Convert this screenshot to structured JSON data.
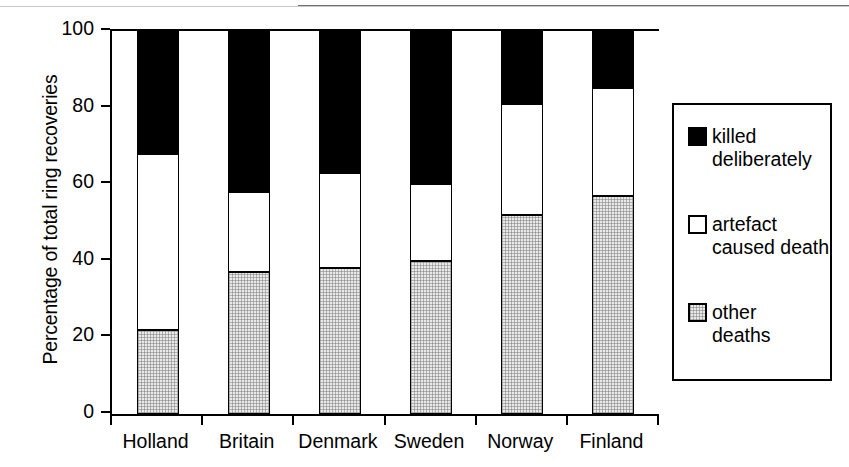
{
  "chart_data": {
    "type": "bar",
    "subtype": "stacked-100-percent",
    "title": "",
    "xlabel": "",
    "ylabel": "Percentage of total ring recoveries",
    "ylim": [
      0,
      100
    ],
    "yticks": [
      0,
      20,
      40,
      60,
      80,
      100
    ],
    "ytick_labels": [
      "0",
      "20",
      "40",
      "60",
      "80",
      "100"
    ],
    "grid": false,
    "legend_position": "right-outside",
    "categories": [
      "Holland",
      "Britain",
      "Denmark",
      "Sweden",
      "Norway",
      "Finland"
    ],
    "series": [
      {
        "name": "other deaths",
        "legend_label": "other\ndeaths",
        "color": "#e9e9e9",
        "pattern": "fine-stipple",
        "values": [
          22,
          37,
          38,
          40,
          52,
          57
        ]
      },
      {
        "name": "artefact caused death",
        "legend_label": "artefact\ncaused death",
        "color": "#ffffff",
        "pattern": "solid",
        "values": [
          46,
          21,
          25,
          20,
          29,
          28
        ]
      },
      {
        "name": "killed deliberately",
        "legend_label": "killed\ndeliberately",
        "color": "#000000",
        "pattern": "solid",
        "values": [
          32,
          42,
          37,
          40,
          19,
          15
        ]
      }
    ],
    "cumulative_tops": {
      "other deaths": [
        22,
        37,
        38,
        40,
        52,
        57
      ],
      "artefact caused death": [
        68,
        58,
        63,
        60,
        81,
        85
      ],
      "killed deliberately": [
        100,
        100,
        100,
        100,
        100,
        100
      ]
    }
  },
  "axes": {
    "y_title": "Percentage of total ring recoveries",
    "y_ticks": [
      "100",
      "80",
      "60",
      "40",
      "20",
      "0"
    ],
    "x_labels": [
      "Holland",
      "Britain",
      "Denmark",
      "Sweden",
      "Norway",
      "Finland"
    ]
  },
  "legend": {
    "items": [
      {
        "label": "killed\ndeliberately",
        "swatch": "black-square-icon"
      },
      {
        "label": "artefact\ncaused death",
        "swatch": "white-square-icon"
      },
      {
        "label": "other\ndeaths",
        "swatch": "stippled-square-icon"
      }
    ]
  },
  "colors": {
    "killed_deliberately": "#000000",
    "artefact_caused_death": "#ffffff",
    "other_deaths": "#e9e9e9",
    "axis": "#000000",
    "background": "#ffffff"
  }
}
